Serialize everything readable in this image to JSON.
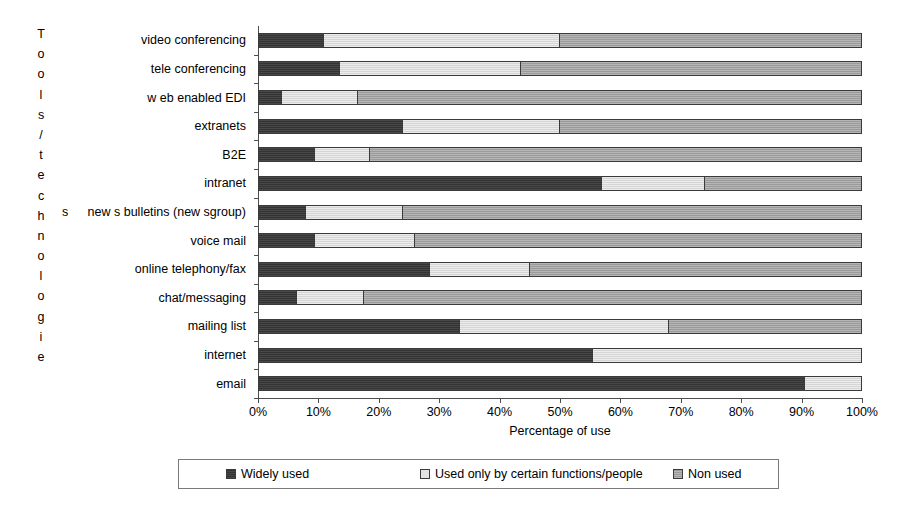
{
  "chart_data": {
    "type": "bar",
    "orientation": "horizontal",
    "stacked": true,
    "stack_total": 100,
    "title": "",
    "xlabel": "Percentage of use",
    "ylabel": "Tools/technologies",
    "xlim": [
      0,
      100
    ],
    "xticks": [
      "0%",
      "10%",
      "20%",
      "30%",
      "40%",
      "50%",
      "60%",
      "70%",
      "80%",
      "90%",
      "100%"
    ],
    "xtick_values": [
      0,
      10,
      20,
      30,
      40,
      50,
      60,
      70,
      80,
      90,
      100
    ],
    "grid": false,
    "legend_position": "bottom",
    "categories": [
      "video conferencing",
      "tele conferencing",
      "w eb enabled EDI",
      "extranets",
      "B2E",
      "intranet",
      "new s bulletins (new sgroup)",
      "voice mail",
      "online telephony/fax",
      "chat/messaging",
      "mailing list",
      "internet",
      "email"
    ],
    "series": [
      {
        "name": "Widely used",
        "color": "#333333",
        "values": [
          11,
          13.5,
          4,
          24,
          9.5,
          57,
          8,
          9.5,
          28.5,
          6.5,
          33.5,
          55.5,
          90.5
        ]
      },
      {
        "name": "Used only by certain functions/people",
        "color": "#d5d5d5",
        "values": [
          39,
          30,
          12.5,
          26,
          9,
          17,
          16,
          16.5,
          16.5,
          11,
          34.5,
          44.5,
          9.5
        ]
      },
      {
        "name": "Non used",
        "color": "#9a9a9a",
        "values": [
          50,
          56.5,
          83.5,
          50,
          81.5,
          26,
          76,
          74,
          55,
          82.5,
          32,
          0,
          0
        ]
      }
    ]
  },
  "axis": {
    "y_title_characters": [
      "T",
      "o",
      "o",
      "l",
      "s",
      "/",
      "t",
      "e",
      "c",
      "h",
      "n",
      "o",
      "l",
      "o",
      "g",
      "i",
      "e"
    ],
    "y_title_stray_character": "s",
    "x_title": "Percentage of use"
  },
  "legend": {
    "items": [
      {
        "label": "Widely used",
        "swatch": "widely-used-swatch"
      },
      {
        "label": "Used only by certain functions/people",
        "swatch": "used-by-certain-swatch"
      },
      {
        "label": "Non used",
        "swatch": "non-used-swatch"
      }
    ]
  }
}
